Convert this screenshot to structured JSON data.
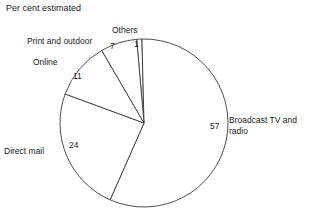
{
  "chart_data": {
    "type": "pie",
    "title": "Per cent estimated",
    "xlabel": "",
    "ylabel": "",
    "legend_position": "none",
    "grid": false,
    "units": "per cent",
    "categories": [
      "Broadcast TV and radio",
      "Direct mail",
      "Online",
      "Print and outdoor",
      "Others"
    ],
    "values": [
      57,
      24,
      11,
      7,
      1
    ],
    "slices": [
      {
        "key": "others",
        "label": "Others",
        "value": 1,
        "value_text": "1",
        "start_angle": -5,
        "end_angle": -1.4
      },
      {
        "key": "broadcast",
        "label": "Broadcast TV and radio",
        "label_line1": "Broadcast TV and",
        "label_line2": "radio",
        "value": 57,
        "value_text": "57",
        "start_angle": -1.4,
        "end_angle": 203.8
      },
      {
        "key": "direct-mail",
        "label": "Direct mail",
        "value": 24,
        "value_text": "24",
        "start_angle": 203.8,
        "end_angle": 290.2
      },
      {
        "key": "online",
        "label": "Online",
        "value": 11,
        "value_text": "11",
        "start_angle": 290.2,
        "end_angle": 329.8
      },
      {
        "key": "print-and-outdoor",
        "label": "Print and outdoor",
        "value": 7,
        "value_text": "7",
        "start_angle": 329.8,
        "end_angle": 355.0
      }
    ],
    "colors": {
      "background": "#ffffff",
      "slice_fill": "#ffffff",
      "slice_stroke": "#3a3a3a",
      "text": "#1a1a1a"
    },
    "geometry": {
      "center_x": 144,
      "center_y": 123,
      "radius": 84
    }
  }
}
